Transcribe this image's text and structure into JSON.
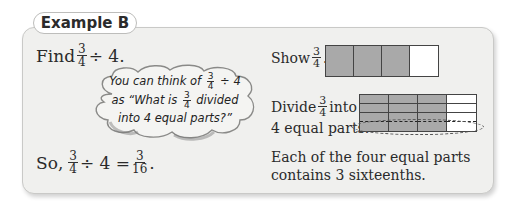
{
  "header": {
    "tab_label": "Example B"
  },
  "problem": {
    "prefix": "Find",
    "fraction": {
      "numerator": "3",
      "denominator": "4"
    },
    "operation": "÷ 4."
  },
  "thought_bubble": {
    "line1_prefix": "You can think of",
    "line1_fraction": {
      "numerator": "3",
      "denominator": "4"
    },
    "line1_suffix": "÷ 4",
    "line2_prefix": "as “What is",
    "line2_fraction": {
      "numerator": "3",
      "denominator": "4"
    },
    "line2_suffix": "divided",
    "line3": "into 4 equal parts?”"
  },
  "conclusion": {
    "prefix": "So,",
    "fraction": {
      "numerator": "3",
      "denominator": "4"
    },
    "middle": "÷ 4 =",
    "result": {
      "numerator": "3",
      "denominator": "16"
    },
    "suffix": "."
  },
  "steps": {
    "show": {
      "prefix": "Show",
      "fraction": {
        "numerator": "3",
        "denominator": "4"
      },
      "suffix": ".",
      "model": {
        "parts": 4,
        "shaded": 3
      }
    },
    "divide": {
      "prefix": "Divide",
      "fraction": {
        "numerator": "3",
        "denominator": "4"
      },
      "suffix": "into",
      "line2": "4 equal parts.",
      "model": {
        "columns": 4,
        "rows": 4,
        "shaded_columns": 3,
        "highlighted_row": 4
      }
    },
    "summary_line1": "Each of the four equal parts",
    "summary_line2": "contains 3 sixteenths."
  },
  "colors": {
    "card_bg": "#f0f0ee",
    "shaded": "#a9a9a9",
    "bubble": "#f4f4f2"
  }
}
